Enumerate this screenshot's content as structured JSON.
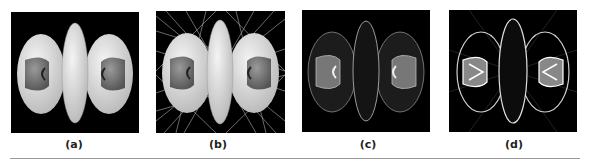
{
  "figure": {
    "panels": [
      {
        "id": "a",
        "caption": "(a)",
        "style": "solid-shaded",
        "description": "shaded isosurface: central ellipsoid with two side lobes containing gray inner cups"
      },
      {
        "id": "b",
        "caption": "(b)",
        "style": "solid-shaded-with-rays",
        "description": "same isosurface with white streak lines radiating in background"
      },
      {
        "id": "c",
        "caption": "(c)",
        "style": "wireframe-dim",
        "description": "semi-transparent wireframe isosurface"
      },
      {
        "id": "d",
        "caption": "(d)",
        "style": "wireframe-bright",
        "description": "bright wireframe isosurface with glowing edges"
      }
    ]
  },
  "colors": {
    "panel_background": "#000000",
    "surface_light": "#e6e6e6",
    "surface_inner": "#7a7a7a",
    "rule": "#9a9a9a",
    "caption": "#222222"
  }
}
